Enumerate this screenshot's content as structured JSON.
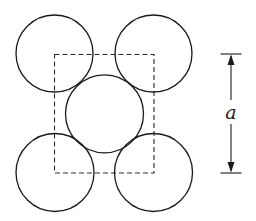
{
  "diagram": {
    "unit_cell": {
      "x": 54.5,
      "y": 54.5,
      "width": 99.5,
      "height": 118.5,
      "style": "dashed"
    },
    "atoms": [
      {
        "name": "corner-top-left",
        "cx": 54.5,
        "cy": 53.5,
        "r": 38.5
      },
      {
        "name": "corner-top-right",
        "cx": 153.5,
        "cy": 53.5,
        "r": 38.5
      },
      {
        "name": "center",
        "cx": 104.5,
        "cy": 113.8,
        "r": 39
      },
      {
        "name": "corner-bottom-left",
        "cx": 55,
        "cy": 172.5,
        "r": 39
      },
      {
        "name": "corner-bottom-right",
        "cx": 153.5,
        "cy": 172.5,
        "r": 39
      }
    ],
    "dimension": {
      "label": "a",
      "x": 231,
      "y_top": 54,
      "y_bottom": 173,
      "tick_x1": 220.5,
      "tick_x2": 241.5
    },
    "colors": {
      "stroke": "#1a1a1a",
      "background": "#ffffff"
    }
  }
}
